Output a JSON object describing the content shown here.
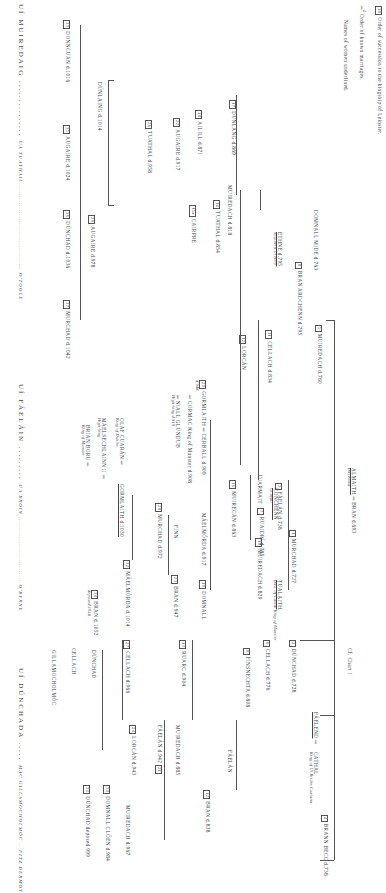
{
  "legend": {
    "succession_box": "18",
    "succession_text": "Order of succession to the kingship of Leinster.",
    "marriage_num": "4",
    "marriage_text": "Order of known marriages.",
    "women_text": "Names of women underlined."
  },
  "chart_ref": "Cf. Chart 1",
  "root": {
    "left": "ALMAITH",
    "left_sub": "Dál Riata",
    "right": "BRAN d.693"
  },
  "nodes": [
    {
      "id": "conchenn",
      "label": "CONCHENN",
      "sub": "Uí Máil",
      "x": 278,
      "y": 488
    },
    {
      "id": "murchad727",
      "num": "1",
      "label": "MURCHAD d.727",
      "x": 296,
      "y": 530
    },
    {
      "id": "muiredach760",
      "num": "5",
      "label": "MUIREDACH d.760",
      "x": 322,
      "y": 325
    },
    {
      "id": "bran795",
      "num": "8",
      "label": "BRAN  ARDCHENN d.795",
      "x": 302,
      "y": 262
    },
    {
      "id": "domnall_mide",
      "label": "DOMNALL MIDE d.763",
      "x": 318,
      "y": 210
    },
    {
      "id": "ethne",
      "label": "ETHNE d.795",
      "sub": "Southern Uí Néill",
      "x": 282,
      "y": 232
    },
    {
      "id": "cellach834",
      "num": "11",
      "label": "CELLACH d.834",
      "x": 272,
      "y": 330
    },
    {
      "id": "lorcan",
      "num": "12",
      "label": "LORCÁN",
      "x": 246,
      "y": 335
    },
    {
      "id": "muiredach818",
      "label": "MUIREDACH d.818",
      "x": 232,
      "y": 185
    },
    {
      "id": "tuathal854",
      "num": "14",
      "label": "TUATHAL d.854",
      "x": 220,
      "y": 200
    },
    {
      "id": "cairpre",
      "num": "15a",
      "label": "CAIRPRE",
      "x": 196,
      "y": 205
    },
    {
      "id": "dunlang869",
      "num": "17",
      "label": "DÚNLANG d.869",
      "x": 236,
      "y": 100
    },
    {
      "id": "ailill871",
      "num": "18",
      "label": "AILILL d.871",
      "x": 202,
      "y": 110
    },
    {
      "id": "augaire917",
      "num": "22",
      "label": "AUGAIRE d.917",
      "x": 180,
      "y": 118
    },
    {
      "id": "tuathal958",
      "num": "26",
      "label": "TUATHAL d.958",
      "x": 152,
      "y": 120
    },
    {
      "id": "dunlaing1014",
      "label": "DÚNLAING d.1014",
      "x": 102,
      "y": 82
    },
    {
      "id": "augaire978",
      "num": "29",
      "label": "AUGAIRE d.978",
      "x": 95,
      "y": 215
    },
    {
      "id": "donncuan1016",
      "num": "33",
      "label": "DONNCUAN d.1016",
      "x": 70,
      "y": 20
    },
    {
      "id": "augaire1024",
      "num": "35",
      "label": "AUGAIRE d.1024",
      "x": 70,
      "y": 125
    },
    {
      "id": "dunchad1036",
      "num": "36",
      "label": "DÚNCHAD d.1036",
      "x": 70,
      "y": 210
    },
    {
      "id": "murchad1042",
      "num": "37",
      "label": "MURCHAD d.1042",
      "x": 70,
      "y": 300
    },
    {
      "id": "faelan738",
      "num": "3",
      "label": "FÁELÁN d.738",
      "x": 282,
      "y": 483
    },
    {
      "id": "ruaidri785",
      "num": "7",
      "label": "RUAIDRÍ d.785",
      "x": 272,
      "y": 508
    },
    {
      "id": "tualaith",
      "label": "TUALAITH",
      "sub": "Dau. of Cathal King of Munster",
      "x": 282,
      "y": 580
    },
    {
      "id": "dunchad728",
      "num": "2",
      "label": "DÚNCHAD d.728",
      "x": 296,
      "y": 640
    },
    {
      "id": "cellach776",
      "num": "6",
      "label": "CELLACH d.776",
      "x": 270,
      "y": 640
    },
    {
      "id": "finsnechta808",
      "num": "9",
      "label": "FÍNSNECHTA d.808",
      "x": 246,
      "y": 648
    },
    {
      "id": "faelend",
      "label": "FÁELEND",
      "x": 310,
      "y": 712
    },
    {
      "id": "cathal",
      "label": "CATHAL",
      "sub": "King of Uí Briúin Cualann",
      "x": 310,
      "y": 752
    },
    {
      "id": "brann_becc",
      "num": "4",
      "label": "BRANN BECC d.738",
      "x": 320,
      "y": 815
    },
    {
      "id": "diarmait",
      "label": "DIARMAIT",
      "x": 250,
      "y": 475
    },
    {
      "id": "muiredach829",
      "num": "10",
      "label": "MUIREDACH d.829",
      "x": 250,
      "y": 538
    },
    {
      "id": "muirecan863",
      "num": "16",
      "label": "MUIRECÁN d.863",
      "x": 222,
      "y": 480
    },
    {
      "id": "cerball909",
      "num": "20",
      "label": "GORMLAITH ═ CERBALL d.909",
      "sub": "d.948",
      "x": 205,
      "y": 395
    },
    {
      "id": "cormac",
      "label": "═ CORMAC King of Munster d.908",
      "x": 190,
      "y": 405
    },
    {
      "id": "niall",
      "label": "═ NIALL GLÚNDUB",
      "sub": "High-king d.919",
      "x": 178,
      "y": 405
    },
    {
      "id": "maelmorda917",
      "label": "MÁELMÓRDA d.917",
      "x": 206,
      "y": 513
    },
    {
      "id": "domnall",
      "num": "19",
      "label": "DOMNALL",
      "x": 202,
      "y": 580
    },
    {
      "id": "finn",
      "label": "FINN",
      "x": 176,
      "y": 525
    },
    {
      "id": "bran947",
      "num": "23",
      "label": "BRAN d.947",
      "x": 172,
      "y": 575
    },
    {
      "id": "murchad972",
      "num": "28",
      "label": "MURCHAD d.972",
      "x": 160,
      "y": 503
    },
    {
      "id": "olaf",
      "label": "OLAF CUARÁN ═",
      "sub": "King of Dublin",
      "x": 122,
      "y": 415
    },
    {
      "id": "gormlaith1030",
      "label": "GORMLAITH d.1030",
      "x": 120,
      "y": 483
    },
    {
      "id": "maelsechlainn",
      "label": "MÁELSECHLAINN II ═",
      "sub": "High-king",
      "x": 102,
      "y": 415
    },
    {
      "id": "brian",
      "label": "BRIAN BORU ═",
      "sub": "King of Munster",
      "x": 84,
      "y": 420
    },
    {
      "id": "maelmorda1014",
      "num": "32",
      "label": "MÁELMÓRDA d.1014",
      "x": 122,
      "y": 560
    },
    {
      "id": "bran1052",
      "num": "34",
      "label": "BRAN d.1052",
      "sub": "deposed 1018",
      "x": 90,
      "y": 590
    },
    {
      "id": "faelan",
      "label": "FÁELÁN",
      "x": 230,
      "y": 720
    },
    {
      "id": "bran838",
      "num": "12",
      "label": "BRAN d.838",
      "x": 224,
      "y": 725
    },
    {
      "id": "muiredach885",
      "label": "MUIREDACH d.885",
      "x": 208,
      "y": 725
    },
    {
      "id": "faelan942",
      "num": "21",
      "label": "FÁELÁN d.942",
      "x": 196,
      "y": 725
    },
    {
      "id": "ruarc904",
      "num": "13",
      "label": "RUARC d.904",
      "x": 190,
      "y": 640
    },
    {
      "id": "lorcan943",
      "num": "24",
      "label": "LORCÁN d.943",
      "x": 160,
      "y": 725
    },
    {
      "id": "muiredach967",
      "label": "MUIREDACH d.967",
      "x": 122,
      "y": 805
    },
    {
      "id": "cellach966",
      "num": "27",
      "label": "CELLACH d.966",
      "x": 112,
      "y": 640
    },
    {
      "id": "dunchad_b",
      "label": "DÚNCHAD",
      "x": 86,
      "y": 650
    },
    {
      "id": "cellach_b",
      "label": "CELLACH",
      "x": 66,
      "y": 648
    },
    {
      "id": "gillamocholmoc",
      "label": "GILLAMOCHOLMÓC",
      "x": 46,
      "y": 650
    },
    {
      "id": "domnall_cloen",
      "num": "30",
      "label": "DOMNALL CLÓEN d.984",
      "x": 106,
      "y": 785
    },
    {
      "id": "dunchad999",
      "num": "31",
      "label": "DÚNCHAD deposed 999",
      "x": 90,
      "y": 785
    }
  ],
  "dynasties": [
    {
      "name": "UÍ MUIREDAIG",
      "dots": "...............",
      "alt": "UA TUATHAIL ...................................... O'TOOLE",
      "x": 16,
      "y": 0
    },
    {
      "name": "UÍ FÁELÁIN",
      "dots": ".........",
      "alt": "UA BROIN ............................. O'BYRNE",
      "x": 16,
      "y": 380
    },
    {
      "name": "UÍ DÚNCHADA",
      "dots": ".....",
      "alt": "MAC GILLAMOCHOLMÓC .. FITZ DERMOT",
      "x": 16,
      "y": 660
    }
  ]
}
